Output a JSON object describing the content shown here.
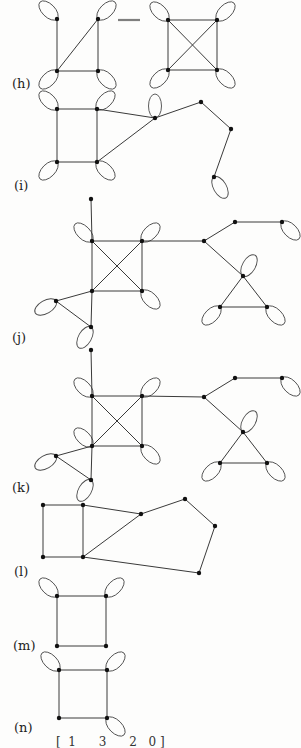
{
  "page": {
    "type": "textbook-figure-page"
  },
  "figures": [
    {
      "label": "(h)",
      "label_pos": [
        12,
        76
      ],
      "vertices": [
        [
          57,
          19
        ],
        [
          98,
          19
        ],
        [
          57,
          71
        ],
        [
          98,
          71
        ],
        [
          168,
          20
        ],
        [
          217,
          20
        ],
        [
          168,
          70
        ],
        [
          217,
          70
        ]
      ],
      "edges": [
        [
          0,
          2
        ],
        [
          1,
          3
        ],
        [
          2,
          3
        ],
        [
          2,
          1
        ],
        [
          4,
          5
        ],
        [
          4,
          6
        ],
        [
          5,
          7
        ],
        [
          6,
          7
        ],
        [
          4,
          7
        ],
        [
          5,
          6
        ]
      ],
      "loops": [
        [
          0,
          -135
        ],
        [
          1,
          -45
        ],
        [
          2,
          135
        ],
        [
          3,
          45
        ],
        [
          4,
          -135
        ],
        [
          5,
          -45
        ],
        [
          6,
          135
        ],
        [
          7,
          45
        ]
      ],
      "extra_lines": [
        [
          118,
          20,
          140,
          20
        ]
      ]
    },
    {
      "label": "(i)",
      "label_pos": [
        14,
        178
      ],
      "vertices": [
        [
          57,
          109
        ],
        [
          97,
          109
        ],
        [
          57,
          162
        ],
        [
          97,
          162
        ],
        [
          155,
          118
        ],
        [
          201,
          102
        ],
        [
          231,
          129
        ],
        [
          214,
          177
        ]
      ],
      "edges": [
        [
          0,
          1
        ],
        [
          0,
          2
        ],
        [
          1,
          3
        ],
        [
          2,
          3
        ],
        [
          1,
          4
        ],
        [
          3,
          4
        ],
        [
          4,
          5
        ],
        [
          5,
          6
        ],
        [
          6,
          7
        ]
      ],
      "loops": [
        [
          0,
          -135
        ],
        [
          1,
          -45
        ],
        [
          2,
          135
        ],
        [
          3,
          45
        ],
        [
          4,
          -90
        ],
        [
          7,
          60
        ]
      ],
      "extra_lines": []
    },
    {
      "label": "(j)",
      "label_pos": [
        12,
        330
      ],
      "vertices": [
        [
          91,
          199
        ],
        [
          92,
          241
        ],
        [
          142,
          241
        ],
        [
          92,
          291
        ],
        [
          142,
          291
        ],
        [
          56,
          301
        ],
        [
          91,
          327
        ],
        [
          204,
          241
        ],
        [
          235,
          222
        ],
        [
          282,
          222
        ],
        [
          243,
          276
        ],
        [
          220,
          307
        ],
        [
          267,
          307
        ]
      ],
      "edges": [
        [
          0,
          1
        ],
        [
          1,
          2
        ],
        [
          1,
          3
        ],
        [
          2,
          4
        ],
        [
          3,
          4
        ],
        [
          1,
          4
        ],
        [
          2,
          3
        ],
        [
          3,
          5
        ],
        [
          5,
          6
        ],
        [
          3,
          6
        ],
        [
          2,
          7
        ],
        [
          7,
          8
        ],
        [
          8,
          9
        ],
        [
          7,
          10
        ],
        [
          10,
          11
        ],
        [
          10,
          12
        ],
        [
          11,
          12
        ]
      ],
      "loops": [
        [
          1,
          -135
        ],
        [
          2,
          -45
        ],
        [
          4,
          45
        ],
        [
          5,
          150
        ],
        [
          6,
          120
        ],
        [
          9,
          45
        ],
        [
          10,
          -60
        ],
        [
          11,
          135
        ],
        [
          12,
          45
        ]
      ],
      "extra_lines": []
    },
    {
      "label": "(k)",
      "label_pos": [
        12,
        480
      ],
      "vertices": [
        [
          91,
          350
        ],
        [
          92,
          396
        ],
        [
          142,
          396
        ],
        [
          92,
          446
        ],
        [
          142,
          446
        ],
        [
          56,
          456
        ],
        [
          91,
          480
        ],
        [
          204,
          397
        ],
        [
          235,
          378
        ],
        [
          282,
          378
        ],
        [
          243,
          432
        ],
        [
          220,
          463
        ],
        [
          267,
          463
        ]
      ],
      "edges": [
        [
          0,
          1
        ],
        [
          1,
          2
        ],
        [
          1,
          3
        ],
        [
          2,
          4
        ],
        [
          3,
          4
        ],
        [
          1,
          4
        ],
        [
          2,
          3
        ],
        [
          3,
          5
        ],
        [
          5,
          6
        ],
        [
          3,
          6
        ],
        [
          2,
          7
        ],
        [
          7,
          8
        ],
        [
          8,
          9
        ],
        [
          7,
          10
        ],
        [
          10,
          11
        ],
        [
          10,
          12
        ],
        [
          11,
          12
        ]
      ],
      "loops": [
        [
          1,
          -135
        ],
        [
          2,
          -45
        ],
        [
          3,
          -135
        ],
        [
          4,
          45
        ],
        [
          5,
          150
        ],
        [
          6,
          120
        ],
        [
          9,
          45
        ],
        [
          10,
          -60
        ],
        [
          11,
          135
        ],
        [
          12,
          45
        ]
      ],
      "extra_lines": []
    },
    {
      "label": "(l)",
      "label_pos": [
        14,
        564
      ],
      "vertices": [
        [
          43,
          505
        ],
        [
          83,
          505
        ],
        [
          43,
          557
        ],
        [
          83,
          557
        ],
        [
          141,
          514
        ],
        [
          185,
          499
        ],
        [
          215,
          526
        ],
        [
          199,
          573
        ]
      ],
      "edges": [
        [
          0,
          1
        ],
        [
          0,
          2
        ],
        [
          1,
          3
        ],
        [
          2,
          3
        ],
        [
          1,
          4
        ],
        [
          3,
          4
        ],
        [
          4,
          5
        ],
        [
          5,
          6
        ],
        [
          6,
          7
        ],
        [
          3,
          7
        ]
      ],
      "loops": [],
      "extra_lines": []
    },
    {
      "label": "(m)",
      "label_pos": [
        13,
        638
      ],
      "vertices": [
        [
          57,
          596
        ],
        [
          106,
          596
        ],
        [
          57,
          646
        ],
        [
          106,
          646
        ]
      ],
      "edges": [
        [
          0,
          1
        ],
        [
          0,
          2
        ],
        [
          1,
          3
        ],
        [
          2,
          3
        ]
      ],
      "loops": [
        [
          0,
          -135
        ],
        [
          1,
          -45
        ]
      ],
      "extra_lines": []
    },
    {
      "label": "(n)",
      "label_pos": [
        14,
        720
      ],
      "vertices": [
        [
          59,
          670
        ],
        [
          107,
          670
        ],
        [
          59,
          718
        ],
        [
          107,
          718
        ]
      ],
      "edges": [
        [
          0,
          1
        ],
        [
          0,
          2
        ],
        [
          1,
          3
        ],
        [
          2,
          3
        ]
      ],
      "loops": [
        [
          0,
          -135
        ],
        [
          1,
          -45
        ],
        [
          3,
          45
        ]
      ],
      "extra_lines": []
    }
  ],
  "matrix_fragment": {
    "text": "[  1      3      2   0 ]"
  },
  "style": {
    "edge_color": "#3a3a3a",
    "vertex_color": "#111111",
    "background": "#fdfdfc"
  }
}
